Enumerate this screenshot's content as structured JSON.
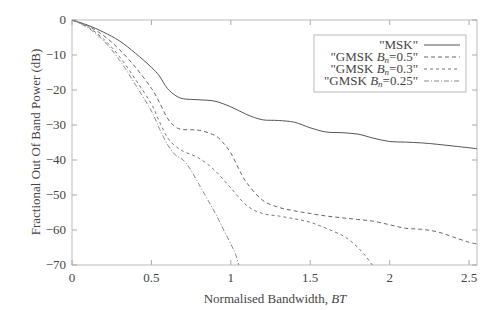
{
  "chart_data": {
    "type": "line",
    "title": "",
    "xlabel": "Normalised Bandwidth, BT",
    "xlabel_plain": "Normalised Bandwidth, ",
    "xlabel_italic": "BT",
    "ylabel": "Fractional Out Of Band Power (dB)",
    "xlim": [
      0,
      2.55
    ],
    "ylim": [
      -70,
      0
    ],
    "xticks": [
      0,
      0.5,
      1,
      1.5,
      2,
      2.5
    ],
    "xtick_labels": [
      "0",
      "0.5",
      "1",
      "1.5",
      "2",
      "2.5"
    ],
    "yticks": [
      0,
      -10,
      -20,
      -30,
      -40,
      -50,
      -60,
      -70
    ],
    "ytick_labels": [
      "0",
      "−10",
      "−20",
      "−30",
      "−40",
      "−50",
      "−60",
      "−70"
    ],
    "grid": false,
    "legend_position": "upper right",
    "series": [
      {
        "name": "\"MSK\"",
        "legend_prefix": "\"MSK\"",
        "legend_sub": "",
        "legend_suffix": "",
        "style": "solid",
        "color": "#555555",
        "x": [
          0,
          0.1,
          0.2,
          0.3,
          0.4,
          0.5,
          0.55,
          0.6,
          0.65,
          0.7,
          0.8,
          0.9,
          1.0,
          1.1,
          1.2,
          1.3,
          1.4,
          1.5,
          1.6,
          1.7,
          1.8,
          1.9,
          2.0,
          2.1,
          2.2,
          2.3,
          2.4,
          2.5,
          2.55
        ],
        "y": [
          0,
          -1.5,
          -3.5,
          -6,
          -9.5,
          -13.5,
          -16,
          -19.5,
          -21.5,
          -22.5,
          -22.8,
          -23.2,
          -24.8,
          -27,
          -28.5,
          -28.7,
          -29.2,
          -30.8,
          -32,
          -32.2,
          -32.6,
          -33.8,
          -34.7,
          -34.9,
          -35.1,
          -35.5,
          -36,
          -36.5,
          -36.8
        ]
      },
      {
        "name": "\"GMSK B_n=0.5\"",
        "legend_prefix": "\"GMSK ",
        "legend_sub": "n",
        "legend_suffix": "=0.5\"",
        "style": "dashed",
        "dash": "4,3",
        "color": "#666666",
        "x": [
          0,
          0.1,
          0.2,
          0.3,
          0.4,
          0.5,
          0.55,
          0.6,
          0.65,
          0.7,
          0.8,
          0.9,
          0.95,
          1.0,
          1.05,
          1.1,
          1.2,
          1.3,
          1.4,
          1.5,
          1.6,
          1.7,
          1.8,
          1.9,
          2.0,
          2.1,
          2.2,
          2.3,
          2.4,
          2.5,
          2.55
        ],
        "y": [
          0,
          -1.7,
          -4.5,
          -8.5,
          -13.5,
          -19.5,
          -23.5,
          -28,
          -30.5,
          -31.3,
          -31.5,
          -33,
          -35,
          -38,
          -42.5,
          -46.5,
          -51.5,
          -53.5,
          -54.5,
          -55.3,
          -56,
          -56.5,
          -57,
          -57.5,
          -58.5,
          -59.5,
          -59.8,
          -60.5,
          -62,
          -63.5,
          -64
        ]
      },
      {
        "name": "\"GMSK B_n=0.3\"",
        "legend_prefix": "\"GMSK ",
        "legend_sub": "n",
        "legend_suffix": "=0.3\"",
        "style": "dashed",
        "dash": "3,3",
        "color": "#777777",
        "x": [
          0,
          0.1,
          0.2,
          0.3,
          0.4,
          0.5,
          0.55,
          0.6,
          0.65,
          0.7,
          0.8,
          0.9,
          1.0,
          1.1,
          1.2,
          1.3,
          1.4,
          1.5,
          1.6,
          1.7,
          1.75,
          1.8,
          1.85,
          1.89
        ],
        "y": [
          0,
          -2,
          -5.5,
          -10.5,
          -17,
          -24,
          -29,
          -33.5,
          -36,
          -37.5,
          -39.5,
          -43,
          -48,
          -53,
          -55.3,
          -56,
          -56.8,
          -57.8,
          -59.5,
          -61.5,
          -63,
          -65,
          -67.5,
          -70
        ]
      },
      {
        "name": "\"GMSK B_n=0.25\"",
        "legend_prefix": "\"GMSK ",
        "legend_sub": "n",
        "legend_suffix": "=0.25\"",
        "style": "dashdot",
        "dash": "5,2,1,2",
        "color": "#888888",
        "x": [
          0,
          0.1,
          0.2,
          0.3,
          0.4,
          0.5,
          0.55,
          0.6,
          0.65,
          0.7,
          0.75,
          0.8,
          0.85,
          0.9,
          0.95,
          1.0,
          1.03,
          1.05
        ],
        "y": [
          0,
          -2.2,
          -6,
          -11.5,
          -18.5,
          -26,
          -31,
          -35.5,
          -38.5,
          -40,
          -43,
          -47,
          -51,
          -55,
          -59.5,
          -64,
          -67,
          -70
        ]
      }
    ]
  }
}
